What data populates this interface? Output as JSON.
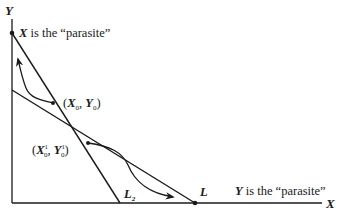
{
  "diagram": {
    "axes": {
      "y_label": "Y",
      "x_label": "X"
    },
    "lines": [
      {
        "name": "L2",
        "label": "L",
        "label_sub": "2",
        "from": [
          12,
          33
        ],
        "to": [
          120,
          203
        ]
      },
      {
        "name": "L",
        "label": "L",
        "from": [
          12,
          90
        ],
        "to": [
          195,
          203
        ]
      }
    ],
    "points": {
      "x0y0": {
        "label_open": "(",
        "x": "X",
        "x_sub": "0",
        "sep": ", ",
        "y": "Y",
        "y_sub": "0",
        "label_close": ")"
      },
      "x1y1": {
        "label_open": "(",
        "x": "X",
        "x_sup": "1",
        "x_sub": "0",
        "sep": ", ",
        "y": "Y",
        "y_sup": "1",
        "y_sub": "0",
        "label_close": ")"
      }
    },
    "annotations": {
      "top": {
        "var": "X",
        "text": " is the “parasite”"
      },
      "bottom": {
        "var": "Y",
        "text": " is the “parasite”"
      }
    },
    "colors": {
      "ink": "#1a1a1a",
      "background": "#ffffff"
    }
  }
}
